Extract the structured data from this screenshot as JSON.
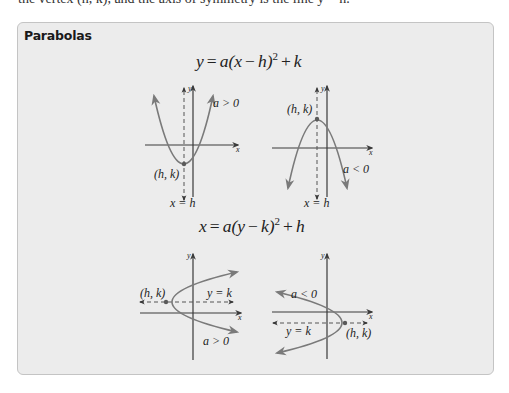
{
  "header": {
    "cutoff_text": "the vertex (h, k), and the axis of symmetry is the line y = h."
  },
  "panel": {
    "title": "Parabolas",
    "colors": {
      "panel_background": "#ececec",
      "panel_border": "#c4c4c4",
      "curve": "#7a7a7a",
      "axis": "#3a3a3a",
      "text": "#222222"
    },
    "sections": [
      {
        "equation": {
          "lhs": "y",
          "eq": "=",
          "coef": "a(x",
          "minus": "−",
          "shift": "h)",
          "exp": "2",
          "plus": "+",
          "const": "k"
        },
        "graphs": [
          {
            "name": "vertical-opens-up",
            "condition": "a > 0",
            "vertex_label": "(h, k)",
            "axis_label": "x = h",
            "x_axis_label": "x",
            "y_axis_label": "y"
          },
          {
            "name": "vertical-opens-down",
            "condition": "a < 0",
            "vertex_label": "(h, k)",
            "axis_label": "x = h",
            "x_axis_label": "x",
            "y_axis_label": "y"
          }
        ]
      },
      {
        "equation": {
          "lhs": "x",
          "eq": "=",
          "coef": "a(y",
          "minus": "−",
          "shift": "k)",
          "exp": "2",
          "plus": "+",
          "const": "h"
        },
        "graphs": [
          {
            "name": "horizontal-opens-right",
            "condition": "a > 0",
            "vertex_label": "(h, k)",
            "axis_label": "y = k",
            "x_axis_label": "x",
            "y_axis_label": "y"
          },
          {
            "name": "horizontal-opens-left",
            "condition": "a < 0",
            "vertex_label": "(h, k)",
            "axis_label": "y = k",
            "x_axis_label": "x",
            "y_axis_label": "y"
          }
        ]
      }
    ]
  }
}
